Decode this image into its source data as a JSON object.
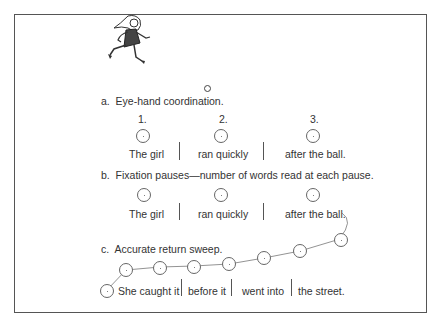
{
  "figure": {
    "illustration": "girl-running-toward-ball",
    "sections": {
      "a": {
        "label": "a.",
        "title": "Eye-hand coordination.",
        "numbers": [
          "1.",
          "2.",
          "3."
        ],
        "phrases": [
          "The girl",
          "ran quickly",
          "after the ball."
        ]
      },
      "b": {
        "label": "b.",
        "title": "Fixation pauses—number of words read at each pause.",
        "phrases": [
          "The girl",
          "ran quickly",
          "after the ball."
        ]
      },
      "c": {
        "label": "c.",
        "title": "Accurate return sweep.",
        "phrases": [
          "She caught it",
          "before it",
          "went into",
          "the street."
        ]
      }
    }
  }
}
